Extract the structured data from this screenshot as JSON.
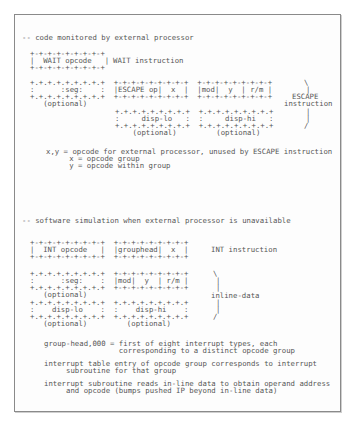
{
  "document": {
    "section1": {
      "heading": "-- code monitored by external processor",
      "wait_box": {
        "top": "+-+-+-+-+-+-+-+-+",
        "middle": "|  WAIT opcode   |",
        "bottom": "+-+-+-+-+-+-+-+-+",
        "label": "WAIT instruction"
      },
      "escape_rows": [
        "+.+.+.+.+.+.+.+.+  +-+-+-+-+-+-+-+-+  +-+-+-+-+-+-+-+-+",
        ":      :seg:    :  |ESCAPE op|  x  |  |mod|  y  | r/m |",
        "+.+.+.+.+.+.+.+.+  +-+-+-+-+-+-+-+-+  +-+-+-+-+-+-+-+-+",
        "   (optional)"
      ],
      "disp_rows": [
        "+.+.+.+.+.+.+.+.+  +.+.+.+.+.+.+.+.+",
        ":     disp-lo   :  :     disp-hi   :",
        "+.+.+.+.+.+.+.+.+  +.+.+.+.+.+.+.+.+",
        "    (optional)         (optional)"
      ],
      "escape_brace": [
        "\\",
        "|",
        "ESCAPE",
        "instruction",
        "|",
        "|",
        "/"
      ],
      "notes": [
        "x,y = opcode for external processor, unused by ESCAPE instruction",
        "   x = opcode group",
        "   y = opcode within group"
      ]
    },
    "section2": {
      "heading": "-- software simulation when external processor is unavailable",
      "int_rows": [
        "+-+-+-+-+-+-+-+-+  +-+-+-+-+-+-+-+-+",
        "|  INT opcode   |  |grouphead|  x  |",
        "+-+-+-+-+-+-+-+-+  +-+-+-+-+-+-+-+-+"
      ],
      "int_label": "INT instruction",
      "seg_rows": [
        "+.+.+.+.+.+.+.+.+  +-+-+-+-+-+-+-+-+",
        ":      :seg:    :  |mod|  y  | r/m |",
        "+.+.+.+.+.+.+.+.+  +-+-+-+-+-+-+-+-+",
        "   (optional)"
      ],
      "disp_rows": [
        "+.+.+.+.+.+.+.+.+  +.+.+.+.+.+.+.+.+",
        ":    disp-lo    :  :    disp-hi    :",
        "+.+.+.+.+.+.+.+.+  +.+.+.+.+.+.+.+.+",
        "   (optional)         (optional)"
      ],
      "inline_brace": [
        "\\",
        "|",
        "|",
        "inline-data",
        "|",
        "|",
        "/"
      ],
      "notes": [
        "group-head,000 = first of eight interrupt types, each",
        "                 corresponding to a distinct opcode group",
        "interrupt table entry of opcode group corresponds to interrupt",
        "     subroutine for that group",
        "interrupt subroutine reads in-line data to obtain operand address",
        "     and opcode (bumps pushed IP beyond in-line data)"
      ]
    }
  }
}
